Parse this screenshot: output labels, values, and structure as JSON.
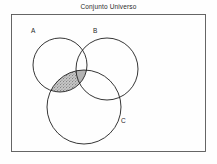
{
  "diagram": {
    "title": "Conjunto Universo",
    "type": "venn-diagram-3-set",
    "universe": {
      "name": "Conjunto Universo",
      "shape": "rectangle",
      "border_color": "#555555",
      "fill_color": "#fefefe",
      "x": 11,
      "y": 14,
      "width": 195,
      "height": 138
    },
    "background_color": "#fefefe",
    "stroke_color": "#1f1f1f",
    "shading_color": "#b4b4b4",
    "sets": [
      {
        "id": "A",
        "label": "A",
        "cx": 60,
        "cy": 65,
        "r": 27,
        "label_x": 31,
        "label_y": 33
      },
      {
        "id": "B",
        "label": "B",
        "cx": 107,
        "cy": 69,
        "r": 31,
        "label_x": 93,
        "label_y": 33
      },
      {
        "id": "C",
        "label": "C",
        "cx": 84,
        "cy": 107,
        "r": 37,
        "label_x": 121,
        "label_y": 123
      }
    ],
    "shaded_region": {
      "expression": "A ∩ C",
      "description": "Intersection of set A and set C",
      "fill": "#b4b4b4",
      "pattern": "stipple"
    }
  }
}
